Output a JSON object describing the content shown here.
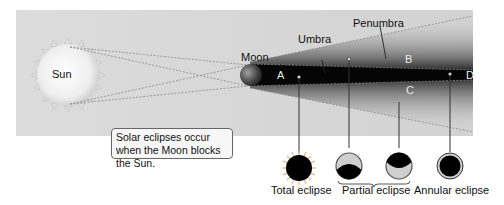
{
  "diagram": {
    "type": "solar eclipse geometry",
    "bodies": {
      "sun": "Sun",
      "moon": "Moon"
    },
    "shadow_labels": {
      "umbra": "Umbra",
      "penumbra": "Penumbra"
    },
    "regions": {
      "a": "A",
      "b": "B",
      "c": "C",
      "d": "D"
    },
    "note": "Solar eclipses occur when the Moon blocks the Sun.",
    "eclipse_types": [
      {
        "label": "Total eclipse",
        "icon": "total-eclipse-icon",
        "region": "A"
      },
      {
        "label": "Partial eclipse",
        "icon": "partial-eclipse-icons",
        "region": "B, C"
      },
      {
        "label": "Annular eclipse",
        "icon": "annular-eclipse-icon",
        "region": "D"
      }
    ],
    "colors": {
      "panel": "#d6d6d6",
      "umbra": "#000000",
      "sun": "#f2f2f2",
      "moon": "#3a3a3a"
    }
  }
}
